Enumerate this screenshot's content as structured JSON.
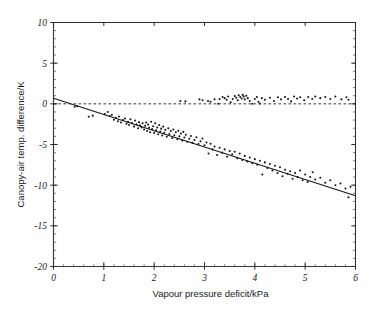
{
  "figure": {
    "background": "#fefefe",
    "ink_color": "#1a1a1a"
  },
  "chart_data": {
    "type": "scatter",
    "title": "",
    "subtitle": "",
    "xlabel": "Vapour pressure deficit/kPa",
    "ylabel": "Canopy-air temp. difference/K",
    "xlim": [
      0,
      6
    ],
    "ylim": [
      -20,
      10
    ],
    "xticks": [
      0,
      1,
      2,
      3,
      4,
      5,
      6
    ],
    "xtick_labels": [
      "0",
      "1",
      "2",
      "3",
      "4",
      "5",
      "6"
    ],
    "yticks": [
      -20,
      -15,
      -10,
      -5,
      0,
      5,
      10
    ],
    "ytick_labels": [
      "-20",
      "-15",
      "-10",
      "-5",
      "0",
      "5",
      "10"
    ],
    "x_minor_step": 0.2,
    "y_minor_step": 1,
    "grid": false,
    "legend": null,
    "legend_position": "none",
    "annotations": [],
    "reference_lines": [
      {
        "name": "zero-line",
        "orientation": "horizontal",
        "value": 0,
        "style": "dashed",
        "label": ""
      }
    ],
    "fit_line": {
      "name": "regression-line",
      "style": "solid",
      "x_start": 0,
      "y_start": 0.7,
      "x_end": 6,
      "y_end": -11.3,
      "slope": -2.0,
      "intercept": 0.7
    },
    "series": [
      {
        "name": "Upper band (near-zero difference)",
        "marker": "dot",
        "points": [
          [
            0.42,
            -0.35
          ],
          [
            0.47,
            -0.3
          ],
          [
            2.52,
            0.35
          ],
          [
            2.62,
            0.3
          ],
          [
            2.9,
            0.55
          ],
          [
            2.96,
            0.45
          ],
          [
            3.07,
            0.35
          ],
          [
            3.12,
            0.25
          ],
          [
            3.2,
            0.55
          ],
          [
            3.27,
            0.0
          ],
          [
            3.3,
            0.6
          ],
          [
            3.36,
            0.85
          ],
          [
            3.4,
            0.7
          ],
          [
            3.44,
            0.5
          ],
          [
            3.47,
            0.9
          ],
          [
            3.52,
            0.2
          ],
          [
            3.56,
            0.6
          ],
          [
            3.6,
            0.95
          ],
          [
            3.63,
            0.75
          ],
          [
            3.66,
            0.45
          ],
          [
            3.68,
            1.05
          ],
          [
            3.71,
            0.85
          ],
          [
            3.74,
            0.65
          ],
          [
            3.76,
            1.1
          ],
          [
            3.78,
            0.9
          ],
          [
            3.8,
            0.55
          ],
          [
            3.83,
            1.0
          ],
          [
            3.86,
            0.7
          ],
          [
            3.9,
            0.35
          ],
          [
            3.95,
            0.0
          ],
          [
            4.0,
            0.6
          ],
          [
            4.04,
            0.85
          ],
          [
            4.07,
            0.25
          ],
          [
            4.1,
            0.05
          ],
          [
            4.14,
            0.7
          ],
          [
            4.2,
            0.5
          ],
          [
            4.3,
            0.75
          ],
          [
            4.38,
            0.35
          ],
          [
            4.46,
            0.8
          ],
          [
            4.52,
            0.55
          ],
          [
            4.6,
            0.85
          ],
          [
            4.66,
            0.6
          ],
          [
            4.72,
            0.3
          ],
          [
            4.78,
            0.9
          ],
          [
            4.84,
            0.65
          ],
          [
            4.9,
            0.8
          ],
          [
            4.98,
            0.45
          ],
          [
            5.06,
            0.85
          ],
          [
            5.14,
            0.6
          ],
          [
            5.2,
            0.9
          ],
          [
            5.3,
            0.7
          ],
          [
            5.4,
            0.85
          ],
          [
            5.5,
            0.6
          ],
          [
            5.6,
            0.9
          ],
          [
            5.72,
            0.55
          ],
          [
            5.82,
            0.8
          ],
          [
            5.86,
            0.5
          ]
        ]
      },
      {
        "name": "Main population (canopy cooling)",
        "marker": "dot",
        "points": [
          [
            0.7,
            -1.6
          ],
          [
            0.78,
            -1.45
          ],
          [
            1.02,
            -1.25
          ],
          [
            1.08,
            -1.0
          ],
          [
            1.12,
            -1.5
          ],
          [
            1.16,
            -1.35
          ],
          [
            1.2,
            -1.95
          ],
          [
            1.24,
            -1.7
          ],
          [
            1.28,
            -2.15
          ],
          [
            1.3,
            -1.55
          ],
          [
            1.34,
            -2.3
          ],
          [
            1.38,
            -2.0
          ],
          [
            1.42,
            -1.8
          ],
          [
            1.45,
            -2.45
          ],
          [
            1.48,
            -2.2
          ],
          [
            1.5,
            -2.6
          ],
          [
            1.53,
            -1.9
          ],
          [
            1.56,
            -2.35
          ],
          [
            1.6,
            -2.8
          ],
          [
            1.62,
            -2.05
          ],
          [
            1.65,
            -2.5
          ],
          [
            1.68,
            -3.0
          ],
          [
            1.7,
            -2.25
          ],
          [
            1.72,
            -2.65
          ],
          [
            1.75,
            -2.9
          ],
          [
            1.77,
            -2.4
          ],
          [
            1.8,
            -3.15
          ],
          [
            1.82,
            -2.7
          ],
          [
            1.84,
            -2.3
          ],
          [
            1.86,
            -3.35
          ],
          [
            1.88,
            -2.55
          ],
          [
            1.9,
            -2.95
          ],
          [
            1.92,
            -3.5
          ],
          [
            1.94,
            -2.2
          ],
          [
            1.96,
            -3.1
          ],
          [
            1.98,
            -2.75
          ],
          [
            2.0,
            -3.6
          ],
          [
            2.02,
            -2.4
          ],
          [
            2.04,
            -3.25
          ],
          [
            2.06,
            -2.9
          ],
          [
            2.08,
            -3.75
          ],
          [
            2.1,
            -2.6
          ],
          [
            2.12,
            -3.4
          ],
          [
            2.14,
            -3.05
          ],
          [
            2.16,
            -3.9
          ],
          [
            2.18,
            -2.8
          ],
          [
            2.2,
            -3.55
          ],
          [
            2.22,
            -3.2
          ],
          [
            2.25,
            -4.05
          ],
          [
            2.28,
            -3.0
          ],
          [
            2.3,
            -3.7
          ],
          [
            2.33,
            -3.35
          ],
          [
            2.36,
            -4.2
          ],
          [
            2.38,
            -3.15
          ],
          [
            2.4,
            -3.85
          ],
          [
            2.43,
            -3.5
          ],
          [
            2.46,
            -4.35
          ],
          [
            2.48,
            -3.3
          ],
          [
            2.5,
            -4.0
          ],
          [
            2.53,
            -3.65
          ],
          [
            2.56,
            -4.5
          ],
          [
            2.58,
            -3.45
          ],
          [
            2.6,
            -4.15
          ],
          [
            2.63,
            -3.8
          ],
          [
            2.66,
            -4.65
          ],
          [
            2.7,
            -4.3
          ],
          [
            2.73,
            -3.95
          ],
          [
            2.76,
            -4.8
          ],
          [
            2.8,
            -4.45
          ],
          [
            2.84,
            -4.1
          ],
          [
            2.88,
            -4.95
          ],
          [
            2.92,
            -4.6
          ],
          [
            2.96,
            -4.25
          ],
          [
            3.0,
            -5.1
          ],
          [
            3.04,
            -4.75
          ],
          [
            3.08,
            -6.1
          ],
          [
            3.12,
            -4.9
          ],
          [
            3.16,
            -5.6
          ],
          [
            3.2,
            -5.25
          ],
          [
            3.25,
            -6.3
          ],
          [
            3.3,
            -5.4
          ],
          [
            3.35,
            -6.0
          ],
          [
            3.4,
            -5.6
          ],
          [
            3.45,
            -6.5
          ],
          [
            3.5,
            -5.8
          ],
          [
            3.55,
            -6.2
          ],
          [
            3.6,
            -5.9
          ],
          [
            3.65,
            -6.7
          ],
          [
            3.7,
            -6.1
          ],
          [
            3.75,
            -6.9
          ],
          [
            3.8,
            -6.4
          ],
          [
            3.85,
            -7.1
          ],
          [
            3.9,
            -6.6
          ],
          [
            3.95,
            -7.3
          ],
          [
            4.0,
            -6.8
          ],
          [
            4.05,
            -7.5
          ],
          [
            4.1,
            -7.0
          ],
          [
            4.15,
            -8.7
          ],
          [
            4.2,
            -7.2
          ],
          [
            4.25,
            -7.9
          ],
          [
            4.3,
            -7.4
          ],
          [
            4.35,
            -8.2
          ],
          [
            4.4,
            -7.6
          ],
          [
            4.45,
            -8.5
          ],
          [
            4.5,
            -7.8
          ],
          [
            4.55,
            -8.9
          ],
          [
            4.6,
            -8.1
          ],
          [
            4.65,
            -8.6
          ],
          [
            4.7,
            -8.3
          ],
          [
            4.75,
            -9.2
          ],
          [
            4.8,
            -8.5
          ],
          [
            4.85,
            -9.0
          ],
          [
            4.9,
            -8.2
          ],
          [
            4.95,
            -9.4
          ],
          [
            5.0,
            -8.7
          ],
          [
            5.05,
            -9.6
          ],
          [
            5.1,
            -9.0
          ],
          [
            5.15,
            -8.4
          ],
          [
            5.2,
            -9.3
          ],
          [
            5.3,
            -9.1
          ],
          [
            5.4,
            -9.7
          ],
          [
            5.5,
            -9.4
          ],
          [
            5.6,
            -10.0
          ],
          [
            5.7,
            -9.8
          ],
          [
            5.8,
            -10.4
          ],
          [
            5.86,
            -11.5
          ],
          [
            5.9,
            -10.2
          ]
        ]
      }
    ]
  }
}
